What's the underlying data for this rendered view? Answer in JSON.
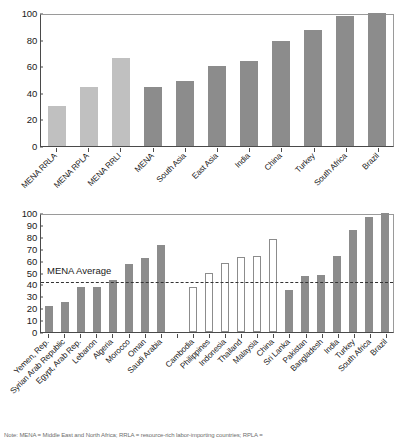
{
  "footnote": {
    "text": "Note: MENA = Middle East and North Africa; RRLA = resource-rich labor-importing countries; RPLA ="
  },
  "charts": {
    "top": {
      "avg_label": "",
      "axis": {
        "ymin": 0,
        "ymax": 100,
        "step": 20
      },
      "yticks": [
        "0",
        "20",
        "40",
        "60",
        "80",
        "100"
      ]
    },
    "bottom": {
      "avg_label": "MENA Average",
      "avg_value": 44,
      "axis": {
        "ymin": 0,
        "ymax": 100,
        "step": 10
      },
      "yticks": [
        "0",
        "10",
        "20",
        "30",
        "40",
        "50",
        "60",
        "70",
        "80",
        "90",
        "100"
      ]
    }
  },
  "chart_data": [
    {
      "type": "bar",
      "title": "",
      "xlabel": "",
      "ylabel": "",
      "ylim": [
        0,
        100
      ],
      "ytick_step": 20,
      "grid": false,
      "legend": "none",
      "categories": [
        "MENA RRLA",
        "MENA RPLA",
        "MENA RRLI",
        "MENA",
        "South Asia",
        "East Asia",
        "India",
        "China",
        "Turkey",
        "South Africa",
        "Brazil"
      ],
      "values": [
        30,
        44,
        66,
        44,
        49,
        60,
        64,
        79,
        87,
        98,
        100
      ],
      "bar_styles": [
        "solid-light",
        "solid-light",
        "solid-light",
        "solid-dark",
        "solid-dark",
        "solid-dark",
        "solid-dark",
        "solid-dark",
        "solid-dark",
        "solid-dark",
        "solid-dark"
      ]
    },
    {
      "type": "bar",
      "title": "",
      "xlabel": "",
      "ylabel": "",
      "ylim": [
        0,
        100
      ],
      "ytick_step": 10,
      "grid": false,
      "legend": "none",
      "reference_line": {
        "label": "MENA Average",
        "value": 44
      },
      "categories": [
        "Yemen, Rep.",
        "Syrian Arab Republic",
        "Egypt, Arab Rep.",
        "Lebanon",
        "Algeria",
        "Morocco",
        "Oman",
        "Saudi Arabia",
        "",
        "Cambodia",
        "Philippines",
        "Indonesia",
        "Thailand",
        "Malaysia",
        "China",
        "Sri Lanka",
        "Pakistan",
        "Bangladesh",
        "India",
        "Turkey",
        "South Africa",
        "Brazil"
      ],
      "values": [
        22,
        25,
        38,
        38,
        44,
        57,
        62,
        73,
        null,
        38,
        50,
        58,
        63,
        64,
        78,
        35,
        47,
        48,
        64,
        86,
        97,
        100
      ],
      "bar_styles": [
        "solid-dark",
        "solid-dark",
        "solid-dark",
        "solid-dark",
        "solid-dark",
        "solid-dark",
        "solid-dark",
        "solid-dark",
        "empty",
        "hollow",
        "hollow",
        "hollow",
        "hollow",
        "hollow",
        "hollow",
        "solid-dark",
        "solid-dark",
        "solid-dark",
        "solid-dark",
        "solid-dark",
        "solid-dark",
        "solid-dark"
      ]
    }
  ]
}
